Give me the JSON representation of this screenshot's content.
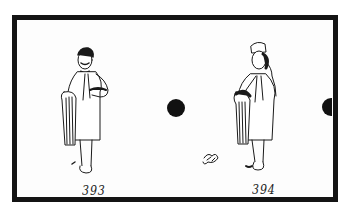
{
  "frame": {
    "border_color": "#141414",
    "background": "#fdfdfd"
  },
  "frames": [
    {
      "number": "393",
      "figure": "man-holding-towels-standing"
    },
    {
      "number": "394",
      "figure": "man-with-cap-hand-to-face"
    }
  ],
  "sprocket_holes": [
    "center-dot",
    "right-edge-half-dot"
  ]
}
